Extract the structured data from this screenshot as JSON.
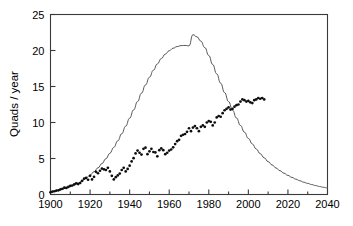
{
  "chart_data": {
    "type": "scatter",
    "title": "",
    "subtitle": "",
    "xlabel": "",
    "ylabel": "Quads / year",
    "xlim": [
      1900,
      2040
    ],
    "ylim": [
      0,
      25
    ],
    "grid": false,
    "legend": null,
    "legend_position": "none",
    "x_ticks": [
      1900,
      1920,
      1940,
      1960,
      1980,
      2000,
      2020,
      2040
    ],
    "x_tick_labels": [
      "1900",
      "1920",
      "1940",
      "1960",
      "1980",
      "2000",
      "2020",
      "2040"
    ],
    "x_minor_ticks": [
      1910,
      1930,
      1950,
      1970,
      1990,
      2010,
      2030
    ],
    "y_ticks": [
      0,
      5,
      10,
      15,
      20,
      25
    ],
    "y_tick_labels": [
      "0",
      "5",
      "10",
      "15",
      "20",
      "25"
    ],
    "y_minor_ticks": [],
    "colors": {
      "curve": "#555555",
      "points": "#0d0d0d",
      "axis": "#3a3a3a",
      "background": "#ffffff"
    },
    "series": [
      {
        "name": "model curve",
        "type": "line",
        "x": [
          1900,
          1902,
          1904,
          1906,
          1908,
          1910,
          1912,
          1914,
          1916,
          1918,
          1920,
          1922,
          1924,
          1926,
          1928,
          1930,
          1932,
          1934,
          1936,
          1938,
          1940,
          1942,
          1944,
          1946,
          1948,
          1950,
          1952,
          1954,
          1956,
          1958,
          1960,
          1962,
          1964,
          1966,
          1968,
          1970,
          1972,
          1974,
          1976,
          1978,
          1980,
          1982,
          1984,
          1986,
          1988,
          1990,
          1992,
          1994,
          1996,
          1998,
          2000,
          2002,
          2004,
          2006,
          2008,
          2010,
          2012,
          2014,
          2016,
          2018,
          2020,
          2022,
          2024,
          2026,
          2028,
          2030,
          2032,
          2034,
          2036,
          2038,
          2040
        ],
        "y": [
          0.35,
          0.45,
          0.58,
          0.73,
          0.9,
          1.1,
          1.33,
          1.6,
          1.92,
          2.28,
          2.7,
          3.17,
          3.7,
          4.3,
          4.97,
          5.72,
          6.55,
          7.45,
          8.44,
          9.49,
          10.6,
          11.75,
          12.92,
          14.08,
          15.21,
          16.28,
          17.26,
          18.13,
          18.88,
          19.49,
          19.97,
          20.32,
          20.55,
          20.68,
          20.7,
          20.65,
          22.2,
          21.9,
          21.3,
          20.4,
          19.3,
          18.05,
          16.75,
          15.45,
          14.15,
          12.9,
          11.72,
          10.62,
          9.6,
          8.66,
          7.8,
          7.02,
          6.31,
          5.67,
          5.09,
          4.57,
          4.1,
          3.68,
          3.3,
          2.96,
          2.65,
          2.38,
          2.13,
          1.91,
          1.71,
          1.54,
          1.38,
          1.24,
          1.11,
          1.0,
          0.9
        ]
      },
      {
        "name": "observed data",
        "type": "scatter",
        "x": [
          1900,
          1901,
          1902,
          1903,
          1904,
          1905,
          1906,
          1907,
          1908,
          1909,
          1910,
          1911,
          1912,
          1913,
          1914,
          1915,
          1916,
          1917,
          1918,
          1919,
          1920,
          1921,
          1922,
          1923,
          1924,
          1925,
          1926,
          1927,
          1928,
          1929,
          1930,
          1931,
          1932,
          1933,
          1934,
          1935,
          1936,
          1937,
          1938,
          1939,
          1940,
          1941,
          1942,
          1943,
          1944,
          1945,
          1946,
          1947,
          1948,
          1949,
          1950,
          1951,
          1952,
          1953,
          1954,
          1955,
          1956,
          1957,
          1958,
          1959,
          1960,
          1961,
          1962,
          1963,
          1964,
          1965,
          1966,
          1967,
          1968,
          1969,
          1970,
          1971,
          1972,
          1973,
          1974,
          1975,
          1976,
          1977,
          1978,
          1979,
          1980,
          1981,
          1982,
          1983,
          1984,
          1985,
          1986,
          1987,
          1988,
          1989,
          1990,
          1991,
          1992,
          1993,
          1994,
          1995,
          1996,
          1997,
          1998,
          1999,
          2000,
          2001,
          2002,
          2003,
          2004,
          2005,
          2006,
          2007,
          2008
        ],
        "y": [
          0.3,
          0.4,
          0.45,
          0.55,
          0.58,
          0.7,
          0.8,
          0.95,
          0.92,
          1.05,
          1.2,
          1.25,
          1.4,
          1.55,
          1.45,
          1.6,
          1.9,
          2.2,
          2.3,
          2.05,
          2.6,
          2.1,
          2.45,
          3.15,
          2.95,
          3.3,
          3.6,
          3.5,
          3.4,
          3.7,
          3.2,
          2.6,
          2.1,
          2.4,
          2.65,
          2.9,
          3.4,
          3.7,
          3.2,
          3.55,
          4.0,
          4.6,
          5.05,
          5.7,
          6.1,
          5.8,
          5.55,
          6.35,
          6.5,
          5.6,
          6.0,
          6.35,
          5.9,
          5.85,
          5.3,
          6.15,
          6.4,
          6.15,
          5.6,
          5.8,
          6.1,
          6.25,
          6.55,
          7.0,
          7.4,
          7.6,
          8.15,
          8.3,
          8.4,
          8.7,
          9.2,
          8.8,
          9.3,
          9.5,
          9.2,
          8.8,
          9.4,
          9.6,
          9.4,
          10.0,
          10.2,
          10.1,
          9.6,
          10.0,
          10.7,
          10.9,
          10.8,
          11.3,
          11.7,
          11.9,
          12.1,
          11.8,
          11.9,
          12.2,
          12.4,
          12.5,
          12.9,
          13.2,
          13.1,
          12.9,
          13.0,
          12.8,
          12.7,
          13.1,
          13.2,
          13.4,
          13.3,
          13.4,
          13.2
        ]
      }
    ],
    "notes": {
      "curve_peak_value": 22.2,
      "curve_peak_year": 1972,
      "data_peak_value": 20.5,
      "data_peak_year": 1970,
      "data_secondary_peak_value": 19.0,
      "data_secondary_peak_year": 1984,
      "data_last_value": 10.5,
      "data_last_year": 2008
    }
  },
  "axis": {
    "ylabel": "Quads / year",
    "xlabel": ""
  }
}
